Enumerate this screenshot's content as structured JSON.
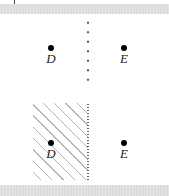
{
  "figure": {
    "top_panel": {
      "boundary": "dotted",
      "shaded_region": false,
      "points": [
        {
          "label": "D"
        },
        {
          "label": "E"
        }
      ]
    },
    "bottom_panel": {
      "boundary": "dotted",
      "shaded_region": true,
      "shaded_side": "left",
      "points": [
        {
          "label": "D"
        },
        {
          "label": "E"
        }
      ]
    },
    "colors": {
      "band": "#dcdcdc",
      "hatch": "#b5b5b5",
      "point": "#000000"
    }
  }
}
